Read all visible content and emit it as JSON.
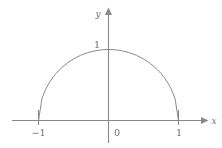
{
  "figure": {
    "name": "upper-unit-semicircle",
    "background_color": "#ffffff",
    "line_color": "#8a8a8a",
    "curve_color": "#8a8a8a",
    "text_color": "#6e6e6e",
    "axes": {
      "x_axis_label": "x",
      "y_axis_label": "y",
      "x_ticks": [
        {
          "label": "−1",
          "value": -1
        },
        {
          "label": "1",
          "value": 1
        }
      ],
      "y_ticks": [
        {
          "label": "1",
          "value": 1
        }
      ],
      "origin_label": "0"
    }
  },
  "chart_data": {
    "type": "line",
    "title": "",
    "subtitle": "",
    "xlabel": "x",
    "ylabel": "y",
    "xlim": [
      -1.37,
      1.37
    ],
    "ylim": [
      -0.33,
      1.22
    ],
    "grid": false,
    "legend": null,
    "annotations": [],
    "xticks": [
      -1,
      0,
      1
    ],
    "xticklabels": [
      "−1",
      "0",
      "1"
    ],
    "yticks": [
      1
    ],
    "yticklabels": [
      "1"
    ],
    "series": [
      {
        "name": "upper unit semicircle",
        "equation": "y = sqrt(1 - x^2)",
        "color": "#8a8a8a",
        "x": [
          -1.0,
          -0.95,
          -0.9,
          -0.85,
          -0.8,
          -0.75,
          -0.7,
          -0.65,
          -0.6,
          -0.55,
          -0.5,
          -0.45,
          -0.4,
          -0.35,
          -0.3,
          -0.25,
          -0.2,
          -0.15,
          -0.1,
          -0.05,
          0.0,
          0.05,
          0.1,
          0.15,
          0.2,
          0.25,
          0.3,
          0.35,
          0.4,
          0.45,
          0.5,
          0.55,
          0.6,
          0.65,
          0.7,
          0.75,
          0.8,
          0.85,
          0.9,
          0.95,
          1.0
        ],
        "y": [
          0.0,
          0.312,
          0.436,
          0.527,
          0.6,
          0.661,
          0.714,
          0.76,
          0.8,
          0.835,
          0.866,
          0.893,
          0.917,
          0.937,
          0.954,
          0.968,
          0.98,
          0.989,
          0.995,
          0.999,
          1.0,
          0.999,
          0.995,
          0.989,
          0.98,
          0.968,
          0.954,
          0.937,
          0.917,
          0.893,
          0.866,
          0.835,
          0.8,
          0.76,
          0.714,
          0.661,
          0.6,
          0.527,
          0.436,
          0.312,
          0.0
        ]
      }
    ]
  }
}
